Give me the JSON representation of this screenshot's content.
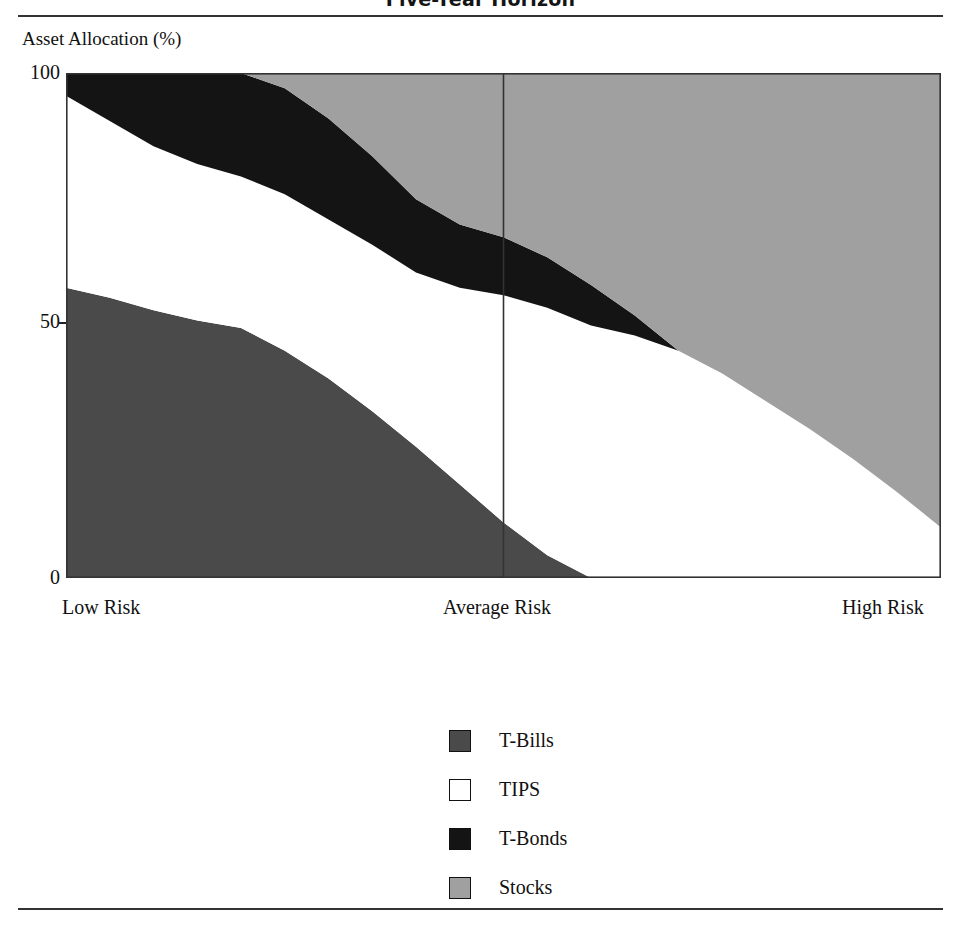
{
  "figure": {
    "title": "Five-Year Horizon",
    "axis_caption": "Asset Allocation (%)"
  },
  "chart_data": {
    "type": "area",
    "stacked": true,
    "title": "Five-Year Horizon",
    "ylabel": "Asset Allocation (%)",
    "xlabel": "",
    "ylim": [
      0,
      100
    ],
    "yticks": [
      "0",
      "50",
      "100"
    ],
    "ytick_values": [
      0,
      50,
      100
    ],
    "grid": false,
    "legend_position": "bottom-center",
    "x_axis_type": "risk-continuum",
    "xticks": [
      "Low Risk",
      "Average Risk",
      "High Risk"
    ],
    "xtick_positions": [
      0,
      50,
      100
    ],
    "reference_line": {
      "label": "Average Risk",
      "x": 50
    },
    "x": [
      0,
      5,
      10,
      15,
      20,
      25,
      30,
      35,
      40,
      45,
      50,
      55,
      60,
      65,
      70,
      75,
      80,
      85,
      90,
      95,
      100
    ],
    "series": [
      {
        "name": "T-Bills",
        "color": "#4a4a4a",
        "values": [
          57.5,
          55.5,
          53.0,
          51.0,
          49.5,
          45.0,
          39.5,
          33.0,
          26.0,
          18.5,
          11.0,
          4.5,
          0.0,
          0.0,
          0.0,
          0.0,
          0.0,
          0.0,
          0.0,
          0.0,
          0.0
        ]
      },
      {
        "name": "TIPS",
        "color": "#ffffff",
        "values": [
          38.0,
          35.0,
          32.5,
          31.0,
          30.0,
          31.0,
          31.5,
          33.0,
          34.5,
          39.0,
          45.0,
          49.0,
          50.0,
          48.0,
          45.0,
          40.5,
          35.0,
          29.5,
          23.5,
          17.0,
          10.0
        ]
      },
      {
        "name": "T-Bonds",
        "color": "#141414",
        "values": [
          4.5,
          9.5,
          14.5,
          18.0,
          20.5,
          21.0,
          20.0,
          17.5,
          14.5,
          12.5,
          11.5,
          10.0,
          8.0,
          4.0,
          0.0,
          0.0,
          0.0,
          0.0,
          0.0,
          0.0,
          0.0
        ]
      },
      {
        "name": "Stocks",
        "color": "#a0a0a0",
        "values": [
          0.0,
          0.0,
          0.0,
          0.0,
          0.0,
          3.0,
          9.0,
          16.5,
          25.0,
          30.0,
          32.5,
          36.5,
          42.0,
          48.0,
          55.0,
          59.5,
          65.0,
          70.5,
          76.5,
          83.0,
          90.0
        ]
      }
    ]
  },
  "legend": {
    "items": [
      {
        "label": "T-Bills",
        "color": "#4a4a4a"
      },
      {
        "label": "TIPS",
        "color": "#ffffff"
      },
      {
        "label": "T-Bonds",
        "color": "#141414"
      },
      {
        "label": "Stocks",
        "color": "#a0a0a0"
      }
    ]
  }
}
